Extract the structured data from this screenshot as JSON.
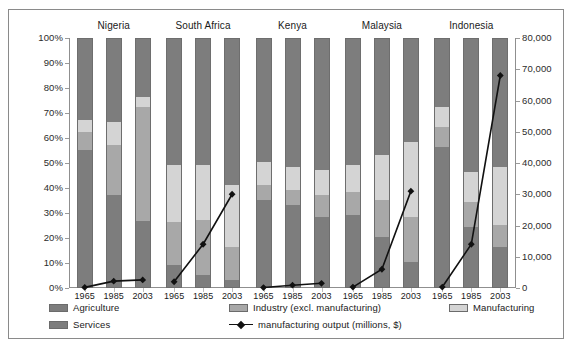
{
  "chart_data": {
    "type": "bar",
    "title": "",
    "subtitle": "",
    "xlabel": "",
    "ylabel": "",
    "y2label": "",
    "grid": false,
    "legend_position": "bottom",
    "ylim": [
      0,
      100
    ],
    "y2lim": [
      0,
      80000
    ],
    "y_ticks": [
      "0%",
      "10%",
      "20%",
      "30%",
      "40%",
      "50%",
      "60%",
      "70%",
      "80%",
      "90%",
      "100%"
    ],
    "y2_ticks": [
      "0",
      "10,000",
      "20,000",
      "30,000",
      "40,000",
      "50,000",
      "60,000",
      "70,000",
      "80,000"
    ],
    "categories": [
      "Nigeria",
      "South Africa",
      "Kenya",
      "Malaysia",
      "Indonesia"
    ],
    "years": [
      "1965",
      "1985",
      "2003"
    ],
    "stack_order": [
      "Agriculture",
      "Industry (excl. manufacturing)",
      "Manufacturing",
      "Services"
    ],
    "series": [
      {
        "name": "Agriculture",
        "color": "#7d7d7d",
        "values": [
          [
            55,
            37,
            26.5
          ],
          [
            9,
            5,
            3
          ],
          [
            35,
            33,
            28
          ],
          [
            29,
            20,
            10
          ],
          [
            56,
            24,
            16
          ]
        ]
      },
      {
        "name": "Industry (excl. manufacturing)",
        "color": "#a8a8a8",
        "values": [
          [
            7,
            20,
            45.5
          ],
          [
            17,
            22,
            13
          ],
          [
            6,
            6,
            9
          ],
          [
            9,
            15,
            18
          ],
          [
            8,
            10,
            9
          ]
        ]
      },
      {
        "name": "Manufacturing",
        "color": "#d4d4d4",
        "values": [
          [
            5,
            9,
            4
          ],
          [
            23,
            22,
            25
          ],
          [
            9,
            9,
            10
          ],
          [
            11,
            18,
            30
          ],
          [
            8,
            12,
            23
          ]
        ]
      },
      {
        "name": "Services",
        "color": "#7d7d7d",
        "values": [
          [
            33,
            34,
            24
          ],
          [
            51,
            51,
            59
          ],
          [
            50,
            52,
            53
          ],
          [
            51,
            47,
            42
          ],
          [
            28,
            54,
            52
          ]
        ]
      }
    ],
    "line_series": {
      "name": "manufacturing output (millions, $)",
      "color": "#111111",
      "axis": "secondary",
      "units": "millions, $",
      "marker": "diamond",
      "values": [
        [
          200,
          2200,
          2600
        ],
        [
          2000,
          14000,
          30000
        ],
        [
          150,
          900,
          1500
        ],
        [
          300,
          6000,
          31000
        ],
        [
          300,
          14000,
          68000
        ]
      ]
    },
    "legend": [
      {
        "label": "Agriculture",
        "swatch": "agriculture",
        "type": "swatch"
      },
      {
        "label": "Industry (excl. manufacturing)",
        "swatch": "industry",
        "type": "swatch"
      },
      {
        "label": "Manufacturing",
        "swatch": "manufacturing",
        "type": "swatch"
      },
      {
        "label": "Services",
        "swatch": "services",
        "type": "swatch"
      },
      {
        "label": "manufacturing output (millions, $)",
        "swatch": "line",
        "type": "line"
      }
    ]
  }
}
